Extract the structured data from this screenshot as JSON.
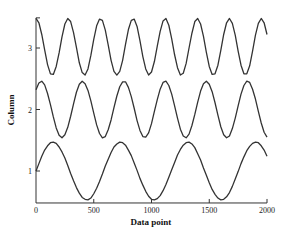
{
  "chart_data": {
    "type": "line",
    "title": "",
    "xlabel": "Data point",
    "ylabel": "Column",
    "xlim": [
      0,
      2000
    ],
    "ylim": [
      0.48,
      3.49
    ],
    "xticks": [
      0,
      500,
      1000,
      1500,
      2000
    ],
    "xtick_labels": [
      "0",
      "500",
      "1000",
      "1500",
      "2000"
    ],
    "yticks": [
      1,
      2,
      3
    ],
    "ytick_labels": [
      "1",
      "2",
      "3"
    ],
    "grid": false,
    "legend": null,
    "x": [
      0,
      25,
      50,
      75,
      100,
      125,
      150,
      175,
      200,
      225,
      250,
      275,
      300,
      325,
      350,
      375,
      400,
      425,
      450,
      475,
      500,
      525,
      550,
      575,
      600,
      625,
      650,
      675,
      700,
      725,
      750,
      775,
      800,
      825,
      850,
      875,
      900,
      925,
      950,
      975,
      1000,
      1025,
      1050,
      1075,
      1100,
      1125,
      1150,
      1175,
      1200,
      1225,
      1250,
      1275,
      1300,
      1325,
      1350,
      1375,
      1400,
      1425,
      1450,
      1475,
      1500,
      1525,
      1550,
      1575,
      1600,
      1625,
      1650,
      1675,
      1700,
      1725,
      1750,
      1775,
      1800,
      1825,
      1850,
      1875,
      1900,
      1925,
      1950,
      1975,
      2000
    ],
    "series": [
      {
        "name": "Column 1",
        "values": [
          1.0,
          1.12,
          1.24,
          1.34,
          1.41,
          1.46,
          1.47,
          1.45,
          1.39,
          1.31,
          1.21,
          1.09,
          0.96,
          0.84,
          0.73,
          0.64,
          0.57,
          0.54,
          0.53,
          0.56,
          0.63,
          0.72,
          0.83,
          0.95,
          1.08,
          1.19,
          1.3,
          1.39,
          1.44,
          1.47,
          1.46,
          1.42,
          1.34,
          1.25,
          1.13,
          1.01,
          0.88,
          0.77,
          0.67,
          0.59,
          0.54,
          0.53,
          0.55,
          0.6,
          0.68,
          0.78,
          0.9,
          1.02,
          1.14,
          1.26,
          1.35,
          1.42,
          1.46,
          1.47,
          1.44,
          1.38,
          1.28,
          1.18,
          1.05,
          0.93,
          0.81,
          0.7,
          0.62,
          0.56,
          0.53,
          0.54,
          0.58,
          0.65,
          0.75,
          0.87,
          0.99,
          1.12,
          1.23,
          1.33,
          1.4,
          1.45,
          1.47,
          1.46,
          1.41,
          1.34,
          1.24
        ]
      },
      {
        "name": "Column 2",
        "values": [
          2.32,
          2.43,
          2.46,
          2.4,
          2.26,
          2.08,
          1.88,
          1.7,
          1.58,
          1.54,
          1.59,
          1.71,
          1.89,
          2.09,
          2.28,
          2.41,
          2.46,
          2.42,
          2.31,
          2.14,
          1.94,
          1.75,
          1.61,
          1.54,
          1.56,
          1.67,
          1.83,
          2.03,
          2.22,
          2.37,
          2.45,
          2.45,
          2.36,
          2.21,
          2.02,
          1.82,
          1.66,
          1.56,
          1.55,
          1.62,
          1.77,
          1.97,
          2.16,
          2.33,
          2.44,
          2.46,
          2.39,
          2.25,
          2.06,
          1.86,
          1.68,
          1.57,
          1.54,
          1.6,
          1.74,
          1.92,
          2.12,
          2.3,
          2.42,
          2.46,
          2.41,
          2.29,
          2.11,
          1.91,
          1.72,
          1.59,
          1.54,
          1.57,
          1.69,
          1.86,
          2.06,
          2.25,
          2.39,
          2.46,
          2.44,
          2.33,
          2.17,
          1.97,
          1.78,
          1.63,
          1.55
        ]
      },
      {
        "name": "Column 3",
        "values": [
          3.48,
          3.41,
          3.22,
          2.97,
          2.73,
          2.58,
          2.57,
          2.7,
          2.92,
          3.18,
          3.39,
          3.48,
          3.43,
          3.25,
          3.01,
          2.76,
          2.6,
          2.56,
          2.66,
          2.88,
          3.14,
          3.36,
          3.47,
          3.45,
          3.29,
          3.05,
          2.8,
          2.62,
          2.56,
          2.62,
          2.8,
          3.06,
          3.3,
          3.45,
          3.47,
          3.35,
          3.12,
          2.86,
          2.66,
          2.56,
          2.61,
          2.78,
          3.03,
          3.27,
          3.44,
          3.48,
          3.37,
          3.15,
          2.89,
          2.68,
          2.56,
          2.59,
          2.75,
          3.0,
          3.24,
          3.43,
          3.48,
          3.39,
          3.19,
          2.93,
          2.7,
          2.57,
          2.58,
          2.72,
          2.96,
          3.22,
          3.41,
          3.48,
          3.4,
          3.21,
          2.95,
          2.72,
          2.58,
          2.58,
          2.71,
          2.95,
          3.21,
          3.4,
          3.48,
          3.41,
          3.22
        ]
      }
    ]
  },
  "style": {
    "line_color": "#333333",
    "axis_color": "#333333",
    "background": "#ffffff"
  }
}
